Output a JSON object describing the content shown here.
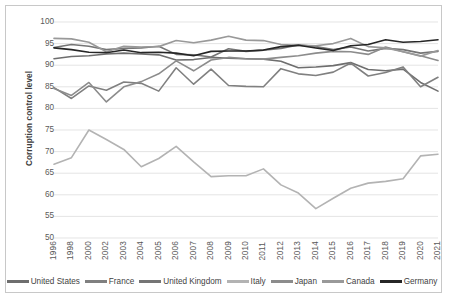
{
  "chart_data": {
    "type": "line",
    "title": "",
    "xlabel": "",
    "ylabel": "Corruption control level",
    "ylim": [
      50,
      100
    ],
    "ytick_step": 5,
    "yticks": [
      100,
      95,
      90,
      85,
      80,
      75,
      70,
      65,
      60,
      55,
      50
    ],
    "grid": true,
    "legend_position": "bottom",
    "categories": [
      "1996",
      "1998",
      "2000",
      "2002",
      "2003",
      "2004",
      "2005",
      "2006",
      "2007",
      "2008",
      "2009",
      "2010",
      "2011",
      "2012",
      "2013",
      "2014",
      "2015",
      "2016",
      "2017",
      "2018",
      "2019",
      "2020",
      "2021"
    ],
    "series": [
      {
        "name": "United States",
        "color": "#6e6e6e",
        "values": [
          91.5,
          92.0,
          92.2,
          92.6,
          92.8,
          92.6,
          92.4,
          91.2,
          91.3,
          91.8,
          91.6,
          91.5,
          91.4,
          90.9,
          89.4,
          89.6,
          89.9,
          90.6,
          89.0,
          88.7,
          89.1,
          86.0,
          84.0
        ]
      },
      {
        "name": "France",
        "color": "#808080",
        "values": [
          84.8,
          82.3,
          85.2,
          84.2,
          86.1,
          85.8,
          84.0,
          89.4,
          85.6,
          89.1,
          85.3,
          85.1,
          85.0,
          89.2,
          88.0,
          87.6,
          88.4,
          90.5,
          87.5,
          88.3,
          89.6,
          85.0,
          87.2
        ]
      },
      {
        "name": "United Kingdom",
        "color": "#757575",
        "values": [
          94.1,
          94.8,
          94.4,
          93.6,
          93.9,
          94.0,
          94.4,
          92.5,
          92.4,
          91.9,
          93.8,
          93.2,
          93.5,
          93.9,
          94.7,
          94.3,
          93.6,
          94.2,
          93.3,
          93.9,
          93.6,
          92.8,
          93.2
        ]
      },
      {
        "name": "Italy",
        "color": "#b3b3b3",
        "values": [
          67.1,
          68.6,
          75.0,
          72.8,
          70.5,
          66.5,
          68.4,
          71.2,
          67.6,
          64.2,
          64.4,
          64.4,
          66.0,
          62.3,
          60.4,
          56.8,
          59.2,
          61.5,
          62.7,
          63.1,
          63.7,
          69.0,
          69.4
        ]
      },
      {
        "name": "Japan",
        "color": "#8c8c8c",
        "values": [
          84.6,
          83.0,
          86.0,
          81.5,
          85.0,
          86.2,
          88.0,
          91.0,
          88.7,
          91.2,
          91.8,
          91.5,
          91.4,
          91.8,
          92.2,
          92.8,
          93.2,
          93.1,
          92.5,
          94.2,
          93.1,
          92.2,
          91.1
        ]
      },
      {
        "name": "Canada",
        "color": "#999999",
        "values": [
          96.2,
          96.1,
          95.3,
          93.1,
          94.4,
          94.2,
          94.3,
          95.7,
          95.2,
          95.8,
          96.7,
          95.8,
          95.7,
          94.8,
          94.6,
          94.5,
          95.0,
          96.2,
          94.3,
          94.0,
          93.1,
          92.1,
          93.4
        ]
      },
      {
        "name": "Germany",
        "color": "#262626",
        "values": [
          94.0,
          93.6,
          93.0,
          92.9,
          93.5,
          92.9,
          93.0,
          92.8,
          92.2,
          93.2,
          93.3,
          93.3,
          93.5,
          94.3,
          94.6,
          94.0,
          93.4,
          94.5,
          94.8,
          95.9,
          95.3,
          95.5,
          95.9
        ]
      }
    ]
  }
}
